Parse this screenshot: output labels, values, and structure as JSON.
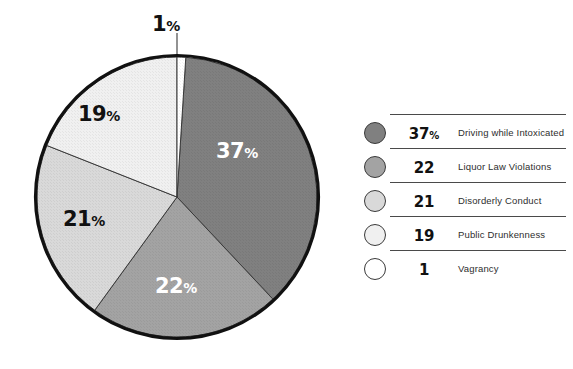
{
  "chart_data": {
    "type": "pie",
    "title": "",
    "subtitle": "",
    "xlabel": "",
    "ylabel": "",
    "grid": false,
    "legend_position": "right",
    "start_angle_deg": 0,
    "direction": "clockwise",
    "categories": [
      "Driving while Intoxicated",
      "Liquor Law Violations",
      "Disorderly Conduct",
      "Public Drunkenness",
      "Vagrancy"
    ],
    "values": [
      37,
      22,
      21,
      19,
      1
    ],
    "value_unit": "percent",
    "slice_order_clockwise_from_top": [
      "Driving while Intoxicated",
      "Liquor Law Violations",
      "Disorderly Conduct",
      "Public Drunkenness",
      "Vagrancy"
    ],
    "slices": [
      {
        "label": "Driving while Intoxicated",
        "value": 37,
        "display": "37",
        "suffix": "%",
        "color": "#808080",
        "label_color": "#ffffff",
        "start_deg": 3.6,
        "sweep_deg": 133.2
      },
      {
        "label": "Liquor Law Violations",
        "value": 22,
        "display": "22",
        "suffix": "%",
        "color": "#a3a3a3",
        "label_color": "#ffffff",
        "start_deg": 136.8,
        "sweep_deg": 79.2
      },
      {
        "label": "Disorderly Conduct",
        "value": 21,
        "display": "21",
        "suffix": "%",
        "color": "#d9d9d9",
        "label_color": "#111111",
        "start_deg": 216.0,
        "sweep_deg": 75.6
      },
      {
        "label": "Public Drunkenness",
        "value": 19,
        "display": "19",
        "suffix": "%",
        "color": "#f0f0f0",
        "label_color": "#111111",
        "start_deg": 291.6,
        "sweep_deg": 68.4
      },
      {
        "label": "Vagrancy",
        "value": 1,
        "display": "1",
        "suffix": "%",
        "color": "#ffffff",
        "label_color": "#111111",
        "start_deg": 0.0,
        "sweep_deg": 3.6
      }
    ]
  },
  "pie": {
    "labels": {
      "l37": {
        "num": "37",
        "pct": "%"
      },
      "l22": {
        "num": "22",
        "pct": "%"
      },
      "l21": {
        "num": "21",
        "pct": "%"
      },
      "l19": {
        "num": "19",
        "pct": "%"
      },
      "l1": {
        "num": "1",
        "pct": "%"
      }
    }
  },
  "legend": {
    "rows": [
      {
        "swatch_color": "#808080",
        "value": "37",
        "suffix": "%",
        "label": "Driving while Intoxicated"
      },
      {
        "swatch_color": "#a3a3a3",
        "value": "22",
        "suffix": "",
        "label": "Liquor Law Violations"
      },
      {
        "swatch_color": "#d9d9d9",
        "value": "21",
        "suffix": "",
        "label": "Disorderly Conduct"
      },
      {
        "swatch_color": "#f0f0f0",
        "value": "19",
        "suffix": "",
        "label": "Public Drunkenness"
      },
      {
        "swatch_color": "#ffffff",
        "value": "1",
        "suffix": "",
        "label": "Vagrancy"
      }
    ]
  },
  "colors": {
    "outline": "#111111",
    "rule": "#4a4a4a",
    "text": "#2e2e2e",
    "background": "#ffffff"
  }
}
